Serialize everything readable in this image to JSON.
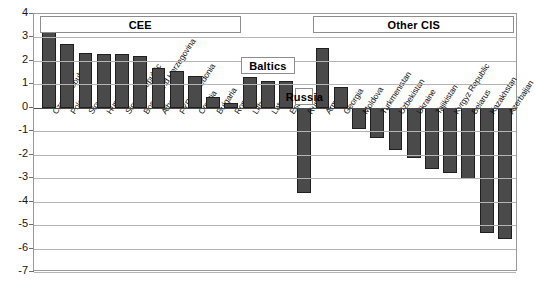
{
  "chart_data": {
    "type": "bar",
    "title": "",
    "xlabel": "",
    "ylabel": "",
    "ylim": [
      -7,
      4
    ],
    "yticks": [
      4,
      3,
      2,
      1,
      0,
      -1,
      -2,
      -3,
      -4,
      -5,
      -6,
      -7
    ],
    "ytick_labels": [
      "4",
      "3",
      "2",
      "1",
      "0",
      "-1",
      "-2",
      "-3",
      "-4",
      "-5",
      "-6",
      "-7"
    ],
    "grid": true,
    "legend": "none",
    "bar_color": "#4a4a4a",
    "categories": [
      "Czech Republic",
      "Poland",
      "Slovenia",
      "Hungary",
      "Slovak Republic",
      "Bosnia and Herzegovina",
      "Albania",
      "FYR Macedonia",
      "Croatia",
      "Bulgaria",
      "Romania",
      "Lithuania",
      "Latvia",
      "Estonia",
      "Russia",
      "Armenia",
      "Georgia",
      "Moldova",
      "Turkmenistan",
      "Uzbekistan",
      "Ukraine",
      "Tajikistan",
      "Kyrgyz Republic",
      "Belarus",
      "Kazakhstan",
      "Azerbaijan"
    ],
    "values": [
      3.35,
      2.7,
      2.35,
      2.3,
      2.3,
      2.2,
      1.7,
      1.55,
      1.35,
      0.45,
      0.2,
      1.3,
      1.15,
      1.15,
      -3.65,
      2.55,
      0.9,
      -0.9,
      -1.3,
      -1.8,
      -2.15,
      -2.6,
      -2.8,
      -3.05,
      -5.35,
      -5.6
    ],
    "groups": [
      {
        "label": "CEE",
        "start": 0,
        "end": 10
      },
      {
        "label": "Baltics",
        "start": 11,
        "end": 13
      },
      {
        "label": "Russia",
        "start": 14,
        "end": 14
      },
      {
        "label": "Other CIS",
        "start": 15,
        "end": 25
      }
    ]
  }
}
